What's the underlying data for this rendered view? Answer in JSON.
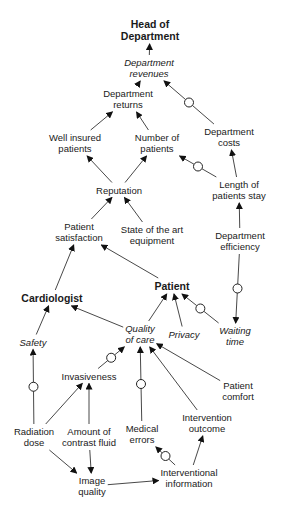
{
  "diagram": {
    "nodes": [
      {
        "id": "head",
        "label": "Head of\nDepartment",
        "x": 150,
        "y": 30,
        "style": "bold"
      },
      {
        "id": "rev",
        "label": "Department\nrevenues",
        "x": 149,
        "y": 68,
        "style": "italic"
      },
      {
        "id": "ret",
        "label": "Department\nreturns",
        "x": 128,
        "y": 99,
        "style": "normal"
      },
      {
        "id": "well",
        "label": "Well insured\npatients",
        "x": 75,
        "y": 143,
        "style": "normal"
      },
      {
        "id": "num",
        "label": "Number of\npatients",
        "x": 157,
        "y": 143,
        "style": "normal"
      },
      {
        "id": "costs",
        "label": "Department\ncosts",
        "x": 229,
        "y": 137,
        "style": "normal"
      },
      {
        "id": "rep",
        "label": "Reputation",
        "x": 119,
        "y": 190,
        "style": "normal"
      },
      {
        "id": "los",
        "label": "Length of\npatients stay",
        "x": 239,
        "y": 190,
        "style": "normal"
      },
      {
        "id": "sat",
        "label": "Patient\nsatisfaction",
        "x": 79,
        "y": 232,
        "style": "normal"
      },
      {
        "id": "equip",
        "label": "State of the art\nequipment",
        "x": 152,
        "y": 235,
        "style": "normal"
      },
      {
        "id": "eff",
        "label": "Department\nefficiency",
        "x": 240,
        "y": 241,
        "style": "normal"
      },
      {
        "id": "patient",
        "label": "Patient",
        "x": 172,
        "y": 286,
        "style": "bold"
      },
      {
        "id": "cardio",
        "label": "Cardiologist",
        "x": 52,
        "y": 298,
        "style": "bold"
      },
      {
        "id": "qoc",
        "label": "Quality\nof care",
        "x": 140,
        "y": 334,
        "style": "italic"
      },
      {
        "id": "privacy",
        "label": "Privacy",
        "x": 184,
        "y": 334,
        "style": "italic"
      },
      {
        "id": "wait",
        "label": "Waiting\ntime",
        "x": 235,
        "y": 336,
        "style": "italic"
      },
      {
        "id": "safety",
        "label": "Safety",
        "x": 33,
        "y": 342,
        "style": "italic"
      },
      {
        "id": "inv",
        "label": "Invasiveness",
        "x": 89,
        "y": 376,
        "style": "normal"
      },
      {
        "id": "comfort",
        "label": "Patient\ncomfort",
        "x": 238,
        "y": 391,
        "style": "normal"
      },
      {
        "id": "interv_out",
        "label": "Intervention\noutcome",
        "x": 207,
        "y": 423,
        "style": "normal"
      },
      {
        "id": "med",
        "label": "Medical\nerrors",
        "x": 142,
        "y": 434,
        "style": "normal"
      },
      {
        "id": "rad",
        "label": "Radiation\ndose",
        "x": 34,
        "y": 437,
        "style": "normal"
      },
      {
        "id": "contrast",
        "label": "Amount of\ncontrast fluid",
        "x": 89,
        "y": 437,
        "style": "normal"
      },
      {
        "id": "interv_info",
        "label": "Interventional\ninformation",
        "x": 189,
        "y": 478,
        "style": "normal"
      },
      {
        "id": "img",
        "label": "Image\nquality",
        "x": 92,
        "y": 486,
        "style": "normal"
      }
    ],
    "edges": [
      {
        "from": "rev",
        "to": "head",
        "negative": false
      },
      {
        "from": "ret",
        "to": "rev",
        "negative": false
      },
      {
        "from": "costs",
        "to": "rev",
        "negative": true
      },
      {
        "from": "well",
        "to": "ret",
        "negative": false
      },
      {
        "from": "num",
        "to": "ret",
        "negative": false
      },
      {
        "from": "rep",
        "to": "well",
        "negative": false
      },
      {
        "from": "rep",
        "to": "num",
        "negative": false
      },
      {
        "from": "los",
        "to": "num",
        "negative": true
      },
      {
        "from": "los",
        "to": "costs",
        "negative": false
      },
      {
        "from": "sat",
        "to": "rep",
        "negative": false
      },
      {
        "from": "equip",
        "to": "rep",
        "negative": false
      },
      {
        "from": "eff",
        "to": "los",
        "negative": false
      },
      {
        "from": "eff",
        "to": "wait",
        "negative": true
      },
      {
        "from": "cardio",
        "to": "sat",
        "negative": false
      },
      {
        "from": "patient",
        "to": "sat",
        "negative": false
      },
      {
        "from": "qoc",
        "to": "patient",
        "negative": false
      },
      {
        "from": "privacy",
        "to": "patient",
        "negative": false
      },
      {
        "from": "wait",
        "to": "patient",
        "negative": true
      },
      {
        "from": "qoc",
        "to": "cardio",
        "negative": false
      },
      {
        "from": "safety",
        "to": "cardio",
        "negative": false
      },
      {
        "from": "rad",
        "to": "safety",
        "negative": true
      },
      {
        "from": "inv",
        "to": "qoc",
        "negative": true
      },
      {
        "from": "med",
        "to": "qoc",
        "negative": true
      },
      {
        "from": "interv_out",
        "to": "qoc",
        "negative": false
      },
      {
        "from": "comfort",
        "to": "qoc",
        "negative": false
      },
      {
        "from": "rad",
        "to": "inv",
        "negative": false
      },
      {
        "from": "contrast",
        "to": "inv",
        "negative": false
      },
      {
        "from": "rad",
        "to": "img",
        "negative": false
      },
      {
        "from": "contrast",
        "to": "img",
        "negative": false
      },
      {
        "from": "img",
        "to": "interv_info",
        "negative": false
      },
      {
        "from": "interv_info",
        "to": "med",
        "negative": true
      },
      {
        "from": "interv_info",
        "to": "interv_out",
        "negative": false
      }
    ]
  }
}
